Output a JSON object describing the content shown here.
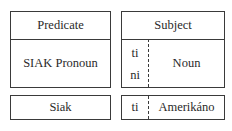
{
  "predicate": {
    "header": "Predicate",
    "body": "SIAK Pronoun",
    "example": "Siak"
  },
  "subject": {
    "header": "Subject",
    "markers": [
      "ti",
      "ni"
    ],
    "body": "Noun",
    "example_marker": "ti",
    "example": "Amerikáno"
  }
}
